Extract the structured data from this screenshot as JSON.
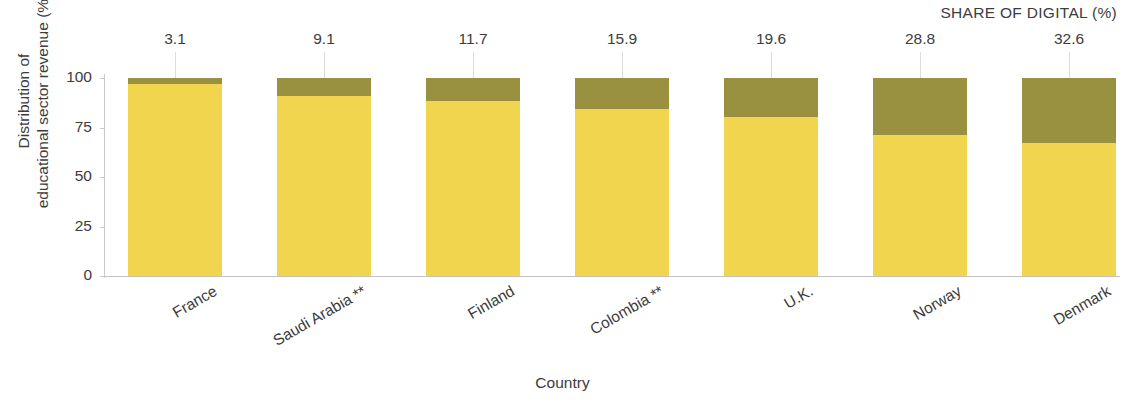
{
  "header": {
    "share_of_digital_label": "SHARE OF DIGITAL (%)"
  },
  "axes": {
    "y_title_line1": "Distribution of",
    "y_title_line2": "educational sector revenue (%)",
    "x_title": "Country",
    "y_ticks": [
      "0",
      "25",
      "50",
      "75",
      "100"
    ]
  },
  "chart_data": {
    "type": "bar",
    "title": "",
    "subtitle": "",
    "xlabel": "Country",
    "ylabel": "Distribution of educational sector revenue (%)",
    "ylim": [
      0,
      100
    ],
    "yticks": [
      0,
      25,
      50,
      75,
      100
    ],
    "grid": false,
    "legend": null,
    "stacked": true,
    "orientation": "vertical",
    "annotation_header": "SHARE OF DIGITAL (%)",
    "categories": [
      "France",
      "Saudi Arabia **",
      "Finland",
      "Colombia **",
      "U.K.",
      "Norway",
      "Denmark"
    ],
    "series": [
      {
        "name": "Non-digital",
        "color": "#f2d54e",
        "values": [
          96.9,
          90.9,
          88.3,
          84.1,
          80.4,
          71.2,
          67.4
        ]
      },
      {
        "name": "Digital",
        "color": "#99913f",
        "values": [
          3.1,
          9.1,
          11.7,
          15.9,
          19.6,
          28.8,
          32.6
        ]
      }
    ],
    "data_labels": [
      "3.1",
      "9.1",
      "11.7",
      "15.9",
      "19.6",
      "28.8",
      "32.6"
    ]
  },
  "bars": [
    {
      "category": "France",
      "label": "3.1",
      "digital": 3.1,
      "base": 96.9,
      "x": 128
    },
    {
      "category": "Saudi Arabia **",
      "label": "9.1",
      "digital": 9.1,
      "base": 90.9,
      "x": 277
    },
    {
      "category": "Finland",
      "label": "11.7",
      "digital": 11.7,
      "base": 88.3,
      "x": 426
    },
    {
      "category": "Colombia **",
      "label": "15.9",
      "digital": 15.9,
      "base": 84.1,
      "x": 575
    },
    {
      "category": "U.K.",
      "label": "19.6",
      "digital": 19.6,
      "base": 80.4,
      "x": 724
    },
    {
      "category": "Norway",
      "label": "28.8",
      "digital": 28.8,
      "base": 71.2,
      "x": 873
    },
    {
      "category": "Denmark",
      "label": "32.6",
      "digital": 32.6,
      "base": 67.4,
      "x": 1022
    }
  ],
  "colors": {
    "base_segment": "#f2d54e",
    "digital_segment": "#99913f",
    "axis": "#c2c2c2",
    "text": "#3c3c3c"
  }
}
